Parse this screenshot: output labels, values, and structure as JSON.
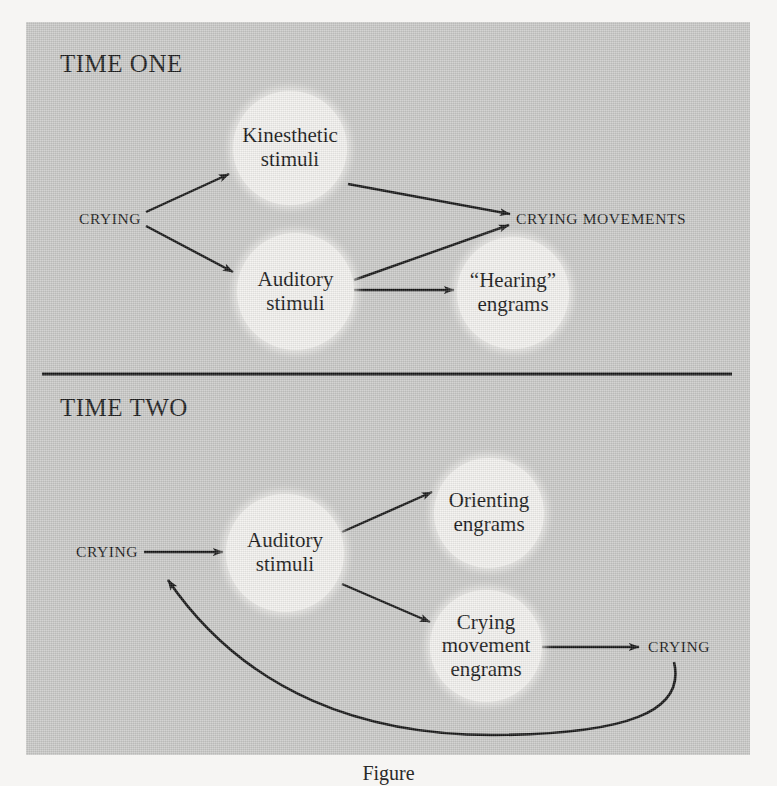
{
  "figure": {
    "panel_background": "#c9c9c7",
    "node_fill": "#f2f1ee",
    "ink_color": "#141414",
    "caption": "Figure"
  },
  "sections": [
    {
      "id": "time-one",
      "title": "TIME ONE"
    },
    {
      "id": "time-two",
      "title": "TIME TWO"
    }
  ],
  "time_one": {
    "title": "TIME ONE",
    "nodes": [
      {
        "id": "kinesthetic-stimuli",
        "label": "Kinesthetic\nstimuli"
      },
      {
        "id": "auditory-stimuli",
        "label": "Auditory\nstimuli"
      },
      {
        "id": "hearing-engrams",
        "label": "“Hearing”\nengrams"
      }
    ],
    "labels": [
      {
        "id": "crying-source",
        "text": "CRYING"
      },
      {
        "id": "crying-movements",
        "text": "CRYING MOVEMENTS"
      }
    ],
    "edges": [
      {
        "from": "CRYING",
        "to": "Kinesthetic stimuli"
      },
      {
        "from": "CRYING",
        "to": "Auditory stimuli"
      },
      {
        "from": "Kinesthetic stimuli",
        "to": "CRYING MOVEMENTS"
      },
      {
        "from": "Auditory stimuli",
        "to": "CRYING MOVEMENTS"
      },
      {
        "from": "Auditory stimuli",
        "to": "“Hearing” engrams"
      }
    ]
  },
  "time_two": {
    "title": "TIME TWO",
    "nodes": [
      {
        "id": "auditory-stimuli-2",
        "label": "Auditory\nstimuli"
      },
      {
        "id": "orienting-engrams",
        "label": "Orienting\nengrams"
      },
      {
        "id": "crying-movement-engrams",
        "label": "Crying\nmovement\nengrams"
      }
    ],
    "labels": [
      {
        "id": "crying-left",
        "text": "CRYING"
      },
      {
        "id": "crying-right",
        "text": "CRYING"
      }
    ],
    "edges": [
      {
        "from": "CRYING",
        "to": "Auditory stimuli"
      },
      {
        "from": "Auditory stimuli",
        "to": "Orienting engrams"
      },
      {
        "from": "Auditory stimuli",
        "to": "Crying movement engrams"
      },
      {
        "from": "Crying movement engrams",
        "to": "CRYING"
      },
      {
        "from": "CRYING",
        "to": "CRYING",
        "style": "curved-feedback"
      }
    ]
  }
}
